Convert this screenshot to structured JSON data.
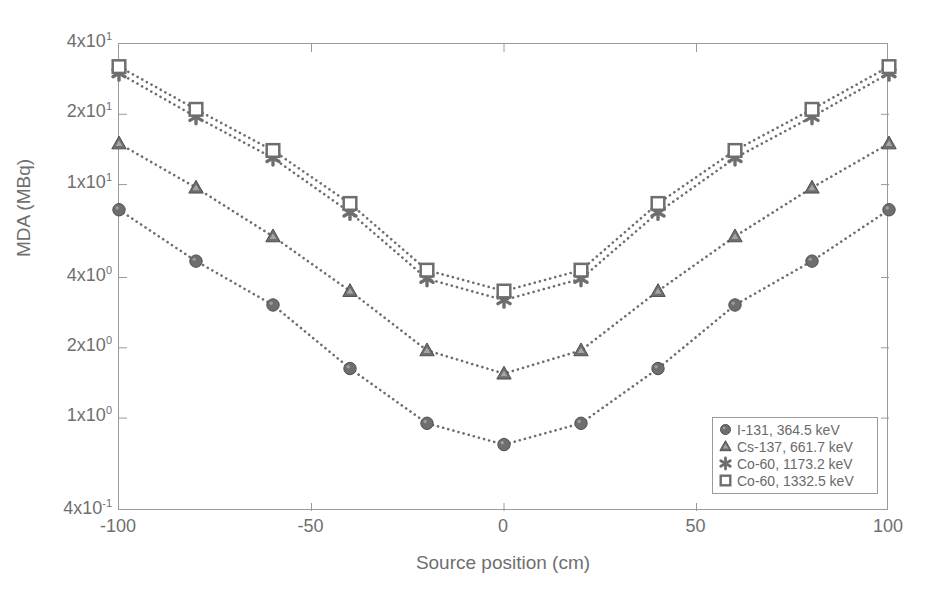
{
  "chart_data": {
    "type": "line",
    "title": "",
    "xlabel": "Source position (cm)",
    "ylabel": "MDA (MBq)",
    "xlim": [
      -100,
      100
    ],
    "ylim": [
      0.4,
      40
    ],
    "yscale": "log",
    "xscale": "linear",
    "grid": false,
    "legend_position": "lower right",
    "xticks": [
      "-100",
      "-50",
      "0",
      "50",
      "100"
    ],
    "xtick_values": [
      -100,
      -50,
      0,
      50,
      100
    ],
    "ytick_labels": [
      "4x10^1",
      "2x10^1",
      "1x10^1",
      "4x10^0",
      "2x10^0",
      "1x10^0",
      "4x10^-1"
    ],
    "ytick_mantissas": [
      "4x10",
      "2x10",
      "1x10",
      "4x10",
      "2x10",
      "1x10",
      "4x10"
    ],
    "ytick_exponents": [
      "1",
      "1",
      "1",
      "0",
      "0",
      "0",
      "-1"
    ],
    "ytick_values": [
      40,
      20,
      10,
      4,
      2,
      1,
      0.4
    ],
    "x": [
      -100,
      -80,
      -60,
      -40,
      -20,
      0,
      20,
      40,
      60,
      80,
      100
    ],
    "series": [
      {
        "name": "I-131, 364.5 keV",
        "marker": "filled-circle",
        "color": "#6e6e6e",
        "linestyle": "dotted",
        "values": [
          7.8,
          4.7,
          3.05,
          1.63,
          0.95,
          0.77,
          0.95,
          1.63,
          3.05,
          4.7,
          7.8
        ]
      },
      {
        "name": "Cs-137, 661.7 keV",
        "marker": "filled-triangle",
        "color": "#6e6e6e",
        "linestyle": "dotted",
        "values": [
          15.0,
          9.7,
          6.0,
          3.5,
          1.95,
          1.55,
          1.95,
          3.5,
          6.0,
          9.7,
          15.0
        ]
      },
      {
        "name": "Co-60, 1173.2 keV",
        "marker": "asterisk",
        "color": "#6e6e6e",
        "linestyle": "dotted",
        "values": [
          30.0,
          19.5,
          13.0,
          7.6,
          3.95,
          3.2,
          3.95,
          7.6,
          13.0,
          19.5,
          30.0
        ]
      },
      {
        "name": "Co-60, 1332.5 keV",
        "marker": "open-square",
        "color": "#6e6e6e",
        "linestyle": "dotted",
        "values": [
          32.0,
          21.0,
          14.0,
          8.3,
          4.3,
          3.5,
          4.3,
          8.3,
          14.0,
          21.0,
          32.0
        ]
      }
    ]
  }
}
